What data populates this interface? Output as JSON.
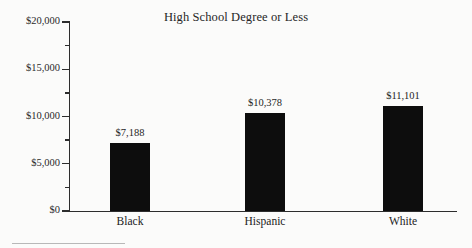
{
  "chart_data": {
    "type": "bar",
    "title": "High School Degree or Less",
    "xlabel": "",
    "ylabel": "",
    "categories": [
      "Black",
      "Hispanic",
      "White"
    ],
    "values": [
      7188,
      10378,
      11101
    ],
    "value_labels": [
      "$7,188",
      "$10,378",
      "$11,101"
    ],
    "ylim": [
      0,
      20000
    ],
    "ytick_values": [
      0,
      5000,
      10000,
      15000,
      20000
    ],
    "ytick_labels": [
      "$0",
      "$5,000",
      "$10,000",
      "$15,000",
      "$20,000"
    ],
    "yminor_tick_values": [
      2500,
      7500,
      12500,
      17500
    ],
    "grid": false,
    "legend": null,
    "bar_color": "#0d0d0d",
    "axis_color": "#2d2d2d",
    "background_color": "#fbfbfa"
  },
  "figure": {
    "title": "High School Degree or Less",
    "footnote_rule": ""
  }
}
